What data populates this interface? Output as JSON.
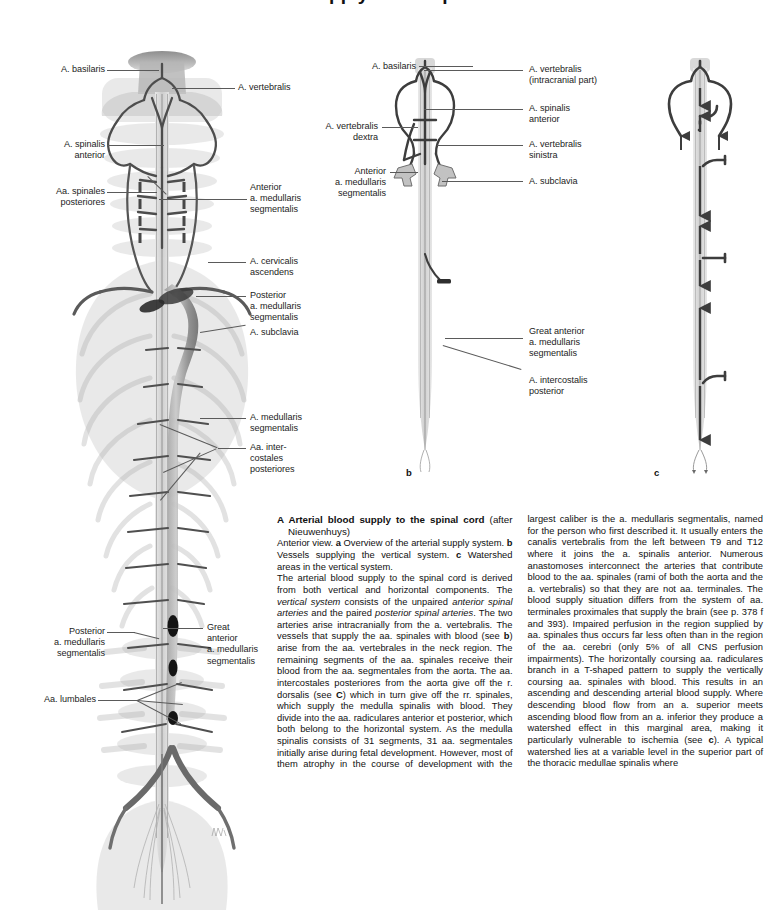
{
  "page": {
    "heading_cut": "Arterial supply of the spinal cord"
  },
  "figure_letters": {
    "b": "b",
    "c": "c"
  },
  "figure_a": {
    "caption_letter": "a",
    "labels_left": [
      {
        "text": "A. basilaris"
      },
      {
        "text": "A. spinalis\nanterior"
      },
      {
        "text": "Aa. spinales\nposteriores"
      },
      {
        "text": "Posterior\na. medullaris\nsegmentalis"
      },
      {
        "text": "Aa. lumbales"
      }
    ],
    "labels_right": [
      {
        "text": "A. vertebralis"
      },
      {
        "text": "Anterior\na. medullaris\nsegmentalis"
      },
      {
        "text": "A. cervicalis\nascendens"
      },
      {
        "text": "Posterior\na. medullaris\nsegmentalis"
      },
      {
        "text": "A. subclavia"
      },
      {
        "text": "A. medullaris\nsegmentalis"
      },
      {
        "text": "Aa. inter-\ncostales\nposteriores"
      },
      {
        "text": "Great\nanterior\na. medullaris\nsegmentalis"
      }
    ]
  },
  "figure_b": {
    "labels_left": [
      {
        "text": "A. basilaris"
      },
      {
        "text": "A. vertebralis\ndextra"
      },
      {
        "text": "Anterior\na. medullaris\nsegmentalis"
      }
    ],
    "labels_right": [
      {
        "text": "A. vertebralis\n(intracranial part)"
      },
      {
        "text": "A. spinalis\nanterior"
      },
      {
        "text": "A. vertebralis\nsinistra"
      },
      {
        "text": "A. subclavia"
      },
      {
        "text": "Great anterior\na. medullaris\nsegmentalis"
      },
      {
        "text": "A. intercostalis\nposterior"
      }
    ]
  },
  "figure_c": {
    "labels": []
  },
  "text": {
    "title_letter": "A",
    "title_line1": "Arterial blood supply to the spinal",
    "title_line2_bold": "cord",
    "title_line2_rest": " (after Nieuwenhuys)",
    "para1_a": "Anterior view. ",
    "para1_b": "a",
    "para1_c": " Overview of the arterial supply system. ",
    "para1_d": "b",
    "para1_e": " Vessels supplying the vertical system. ",
    "para1_f": "c",
    "para1_g": " Watershed areas in the vertical system.",
    "para2_seg": [
      {
        "t": "The arterial blood supply to the spinal cord is derived from both vertical and horizontal components. The ",
        "s": "n"
      },
      {
        "t": "vertical system",
        "s": "i"
      },
      {
        "t": " consists of the unpaired ",
        "s": "n"
      },
      {
        "t": "anterior spinal arteries",
        "s": "i"
      },
      {
        "t": " and the paired ",
        "s": "n"
      },
      {
        "t": "posterior spinal arteries",
        "s": "i"
      },
      {
        "t": ". The two arteries arise intracranially from the a. vertebralis. The vessels that supply the aa. spinales with blood (see ",
        "s": "n"
      },
      {
        "t": "b",
        "s": "b"
      },
      {
        "t": ") arise from the aa. vertebrales in the neck region. The remaining segments of the aa. spinales receive their blood from the aa. segmentales from the aorta. The aa. intercostales posteriores from the aorta give off the r. dorsalis (see ",
        "s": "n"
      },
      {
        "t": "C",
        "s": "b"
      },
      {
        "t": ") which in turn give off the rr. spinales, which supply the medulla spinalis with blood. They divide into the aa. radiculares anterior et posterior, which both belong to the horizontal system. As the medulla spinalis consists of 31 segments, 31 aa. segmentales initially arise during fetal development. However, most of them atrophy in the course of development with the largest caliber is the a. medullaris segmentalis, named for the person who first described it. It usually enters the canalis vertebralis from the left between T9 and T12 where it joins the a. spinalis anterior. Numerous anastomoses interconnect the arteries that contribute blood to the aa. spinales (rami of both the aorta and the a. vertebralis) so that they are not aa. terminales. The blood supply situation differs from the system of aa. terminales proximales that supply the brain (see p. 378 f and 393). Impaired perfusion in the region supplied by aa. spinales thus occurs far less often than in the region of the aa. cerebri (only 5% of all CNS perfusion impairments). The horizontally coursing aa. radiculares branch in a T-shaped pattern to supply the vertically coursing aa. spinales with blood. This results in an ascending and descending arterial blood supply. Where descending blood flow from an a. superior meets ascending blood flow from an a. inferior they produce a watershed effect in this marginal area, making it particularly vulnerable to ischemia (see ",
        "s": "n"
      },
      {
        "t": "c",
        "s": "b"
      },
      {
        "t": "). A typical watershed lies at a variable level in the superior part of the thoracic medullae spinalis where",
        "s": "n"
      }
    ]
  },
  "colors": {
    "artery_dark": "#4a4a4a",
    "artery_mid": "#6e6e6e",
    "bone_light": "#dcdcdc",
    "cord_fill": "#cfcfcf",
    "leader": "#5a5a5a",
    "text": "#111111"
  }
}
